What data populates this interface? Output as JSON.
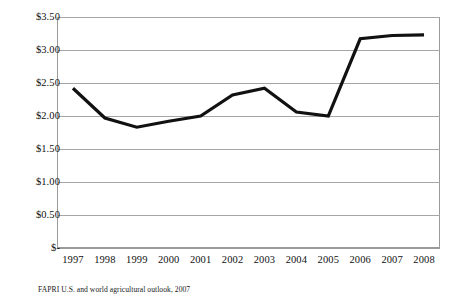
{
  "chart_data": {
    "type": "line",
    "title": "",
    "subtitle": "",
    "xlabel": "",
    "ylabel": "",
    "categories": [
      "1997",
      "1998",
      "1999",
      "2000",
      "2001",
      "2002",
      "2003",
      "2004",
      "2005",
      "2006",
      "2007",
      "2008"
    ],
    "values": [
      2.42,
      1.97,
      1.83,
      1.92,
      2.0,
      2.32,
      2.42,
      2.06,
      2.0,
      3.17,
      3.22,
      3.23
    ],
    "series": [
      {
        "name": "",
        "values": [
          2.42,
          1.97,
          1.83,
          1.92,
          2.0,
          2.32,
          2.42,
          2.06,
          2.0,
          3.17,
          3.22,
          3.23
        ]
      }
    ],
    "ylim": [
      0,
      3.5
    ],
    "y_ticks": [
      0,
      0.5,
      1.0,
      1.5,
      2.0,
      2.5,
      3.0,
      3.5
    ],
    "y_tick_labels": [
      "$-",
      "$0.50",
      "$1.00",
      "$1.50",
      "$2.00",
      "$2.50",
      "$3.00",
      "$3.50"
    ],
    "x_tick_labels": [
      "1997",
      "1998",
      "1999",
      "2000",
      "2001",
      "2002",
      "2003",
      "2004",
      "2005",
      "2006",
      "2007",
      "2008"
    ],
    "grid": true,
    "grid_axis": "y",
    "legend": false,
    "legend_position": "none",
    "line_color": "#111111",
    "grid_color": "#a6a6a6",
    "background_color": "#ffffff",
    "annotations": []
  },
  "source": {
    "note": "FAPRI U.S. and world agricultural outlook, 2007"
  }
}
